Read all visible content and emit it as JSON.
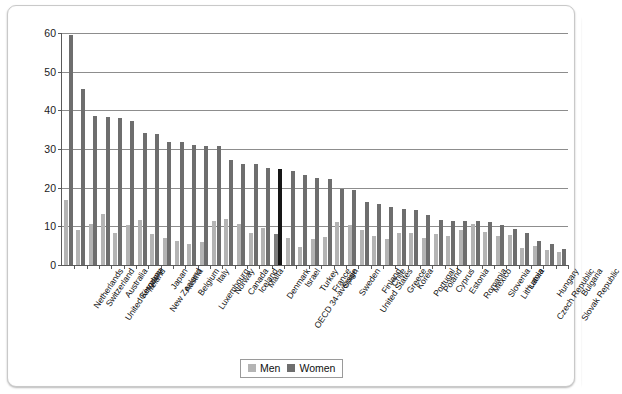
{
  "chart_data": {
    "type": "bar",
    "title": "",
    "subtitle": "",
    "xlabel": "",
    "ylabel": "",
    "ylim": [
      0,
      60
    ],
    "yticks": [
      0,
      10,
      20,
      30,
      40,
      50,
      60
    ],
    "ytick_labels": [
      "0",
      "10",
      "20",
      "30",
      "40",
      "50",
      "60"
    ],
    "grid": true,
    "legend_position": "bottom-center",
    "highlight_category": "OECD 34-average",
    "colors": {
      "men": "#b4b4b4",
      "women": "#6e6e6e",
      "highlight_men": "#7d7d7d",
      "highlight_women": "#161616",
      "gridline": "#8d8d8d",
      "axis": "#5a5a5a"
    },
    "categories": [
      "Netherlands",
      "Switzerland",
      "United Kingdom",
      "Australia",
      "Germany",
      "Ireland",
      "New Zealand",
      "Japan",
      "Austria",
      "Belgium",
      "Luxembourg",
      "Italy",
      "Norway",
      "Canada",
      "Iceland",
      "Malta",
      "Denmark",
      "OECD 34-average",
      "Israel",
      "Turkey",
      "France",
      "Spain",
      "Sweden",
      "United States",
      "Finland",
      "Chile",
      "Greece",
      "Korea",
      "Portugal",
      "Poland",
      "Cyprus",
      "Estonia",
      "Romania",
      "Mexico",
      "Slovenia",
      "Lithuania",
      "Latvia",
      "Czech Republic",
      "Hungary",
      "Slovak Republic",
      "Bulgaria"
    ],
    "series": [
      {
        "name": "Men",
        "color": "#b4b4b4",
        "values": [
          16.8,
          9.1,
          10.6,
          13.1,
          8.4,
          10.3,
          11.6,
          8.0,
          7.0,
          6.3,
          5.4,
          6.0,
          11.4,
          12.0,
          10.5,
          8.3,
          9.5,
          8.0,
          7.0,
          4.6,
          6.7,
          7.2,
          11.0,
          10.4,
          9.0,
          7.6,
          6.6,
          8.3,
          8.4,
          6.9,
          8.0,
          7.6,
          9.0,
          10.5,
          8.5,
          7.5,
          7.8,
          4.3,
          5.0,
          4.0,
          3.4
        ]
      },
      {
        "name": "Women",
        "color": "#6e6e6e",
        "values": [
          59.5,
          45.6,
          38.5,
          38.2,
          37.9,
          37.3,
          34.2,
          33.9,
          31.9,
          31.9,
          31.1,
          30.7,
          30.7,
          27.2,
          26.1,
          26.1,
          25.1,
          24.8,
          24.2,
          23.2,
          22.4,
          22.3,
          19.6,
          19.4,
          16.4,
          15.9,
          14.9,
          14.5,
          14.1,
          12.9,
          11.6,
          11.5,
          11.4,
          11.3,
          11.2,
          10.3,
          9.2,
          8.4,
          6.1,
          5.5,
          4.1
        ]
      }
    ],
    "legend": [
      {
        "label": "Men",
        "color": "#b4b4b4"
      },
      {
        "label": "Women",
        "color": "#6e6e6e"
      }
    ]
  }
}
